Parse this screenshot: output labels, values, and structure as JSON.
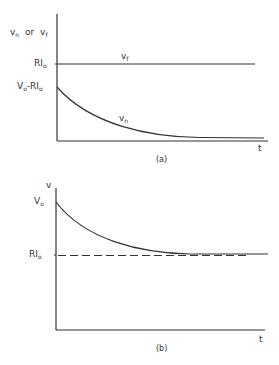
{
  "colors": {
    "ink": "#333333",
    "background": "#ffffff"
  },
  "panel_a": {
    "caption": "(a)",
    "y_axis_label": {
      "v": "v",
      "n": "n",
      "or": "or",
      "v2": "v",
      "f": "f"
    },
    "x_axis_label": "t",
    "ticks": {
      "ri": {
        "main": "RI",
        "sub": "o"
      },
      "v0_minus_ri": {
        "v": "V",
        "o": "o",
        "rest": "-RI",
        "o2": "o"
      }
    },
    "curves": {
      "vf": {
        "main": "v",
        "sub": "f",
        "style": "solid horizontal"
      },
      "vn": {
        "main": "v",
        "sub": "n",
        "style": "exponential decay"
      }
    }
  },
  "panel_b": {
    "caption": "(b)",
    "y_axis_label": "v",
    "x_axis_label": "t",
    "ticks": {
      "v0": {
        "main": "V",
        "sub": "o"
      },
      "ri": {
        "main": "RI",
        "sub": "o"
      }
    },
    "curves": {
      "v": {
        "style": "exponential decay from V0 to RI0"
      },
      "asymptote": {
        "style": "dashed horizontal at RI0"
      }
    }
  }
}
